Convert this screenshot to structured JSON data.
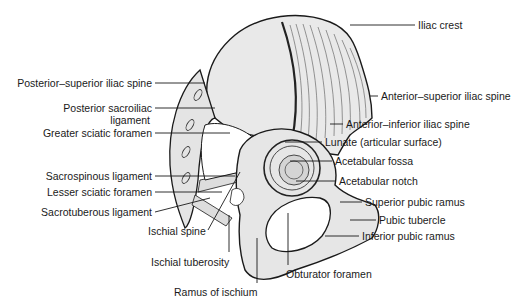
{
  "figure": {
    "colors": {
      "ink": "#1a1a1a",
      "bone_fill": "#e9e9e9",
      "bone_shade": "#cfcfcf",
      "foramen_fill": "#ffffff"
    }
  },
  "labels": {
    "iliac_crest": "Iliac crest",
    "posterior_superior_iliac_spine": "Posterior–superior iliac spine",
    "anterior_superior_iliac_spine": "Anterior–superior iliac spine",
    "posterior_sacroiliac_ligament_1": "Posterior sacroiliac",
    "posterior_sacroiliac_ligament_2": "ligament",
    "anterior_inferior_iliac_spine": "Anterior–inferior iliac spine",
    "greater_sciatic_foramen": "Greater sciatic foramen",
    "lunate": "Lunate (articular surface)",
    "acetabular_fossa": "Acetabular fossa",
    "sacrospinous_ligament": "Sacrospinous ligament",
    "acetabular_notch": "Acetabular notch",
    "lesser_sciatic_foramen": "Lesser sciatic foramen",
    "superior_pubic_ramus": "Superior pubic ramus",
    "sacrotuberous_ligament": "Sacrotuberous ligament",
    "pubic_tubercle": "Pubic tubercle",
    "ischial_spine": "Ischial spine",
    "inferior_pubic_ramus": "Inferior pubic ramus",
    "ischial_tuberosity": "Ischial tuberosity",
    "obturator_foramen": "Obturator foramen",
    "ramus_of_ischium": "Ramus of ischium"
  }
}
